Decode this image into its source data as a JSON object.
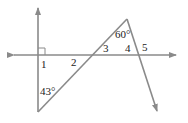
{
  "diagram": {
    "type": "geometry-angles",
    "colors": {
      "line": "#8a8a8a",
      "text": "#222222",
      "background": "#ffffff"
    },
    "labels": {
      "angle1": "1",
      "angle2": "2",
      "angle3": "3",
      "angle4": "4",
      "angle5": "5",
      "angle_top": "60°",
      "angle_bottom": "43°"
    },
    "marks": {
      "right_angle": "right-angle at angle 1"
    }
  }
}
